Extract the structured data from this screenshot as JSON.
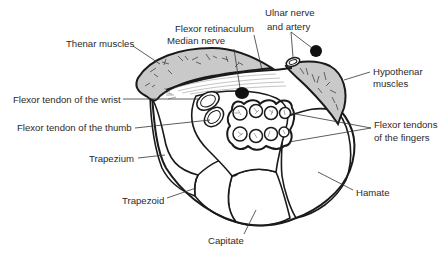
{
  "diagram": {
    "colors": {
      "muscle_fill": "#c9c9c9",
      "outline": "#1a1a1a",
      "label_text": "#2a2a2a",
      "background": "#ffffff",
      "nerve_artery_fill": "#111111"
    },
    "labels": {
      "thenar_muscles": "Thenar muscles",
      "flexor_retinaculum": "Flexor retinaculum",
      "median_nerve": "Median nerve",
      "ulnar_nerve_line1": "Ulnar nerve",
      "ulnar_nerve_line2": "and artery",
      "hypothenar_line1": "Hypothenar",
      "hypothenar_line2": "muscles",
      "flexor_tendon_wrist": "Flexor tendon of the wrist",
      "flexor_tendon_thumb": "Flexor tendon of the thumb",
      "flexor_tendons_fingers_line1": "Flexor tendons",
      "flexor_tendons_fingers_line2": "of the fingers",
      "trapezium": "Trapezium",
      "trapezoid": "Trapezoid",
      "capitate": "Capitate",
      "hamate": "Hamate"
    },
    "structures": {
      "finger_tendon_count": 8,
      "tendon_rows": 2,
      "tendons_per_row": 4
    }
  }
}
